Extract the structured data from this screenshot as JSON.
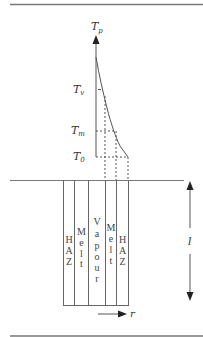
{
  "diagram": {
    "type": "temperature-profile-and-zones",
    "axis": {
      "label_main": "T",
      "label_sub": "p"
    },
    "levels": [
      {
        "main": "T",
        "sub": "v",
        "name": "vapourisation-temperature"
      },
      {
        "main": "T",
        "sub": "m",
        "name": "melting-temperature"
      },
      {
        "main": "T",
        "sub": "0",
        "name": "initial-temperature"
      }
    ],
    "zones": [
      {
        "label": "HAZ",
        "chars": [
          "H",
          "A",
          "Z"
        ]
      },
      {
        "label": "Melt",
        "chars": [
          "M",
          "e",
          "l",
          "t"
        ]
      },
      {
        "label": "Vapour",
        "chars": [
          "V",
          "a",
          "p",
          "o",
          "u",
          "r"
        ]
      },
      {
        "label": "Melt",
        "chars": [
          "M",
          "e",
          "l",
          "t"
        ]
      },
      {
        "label": "HAZ",
        "chars": [
          "H",
          "A",
          "Z"
        ]
      }
    ],
    "depth_label": "l",
    "radial_label": "r",
    "colors": {
      "line": "#555555",
      "rule": "#7a7a7a",
      "text": "#333333"
    }
  }
}
